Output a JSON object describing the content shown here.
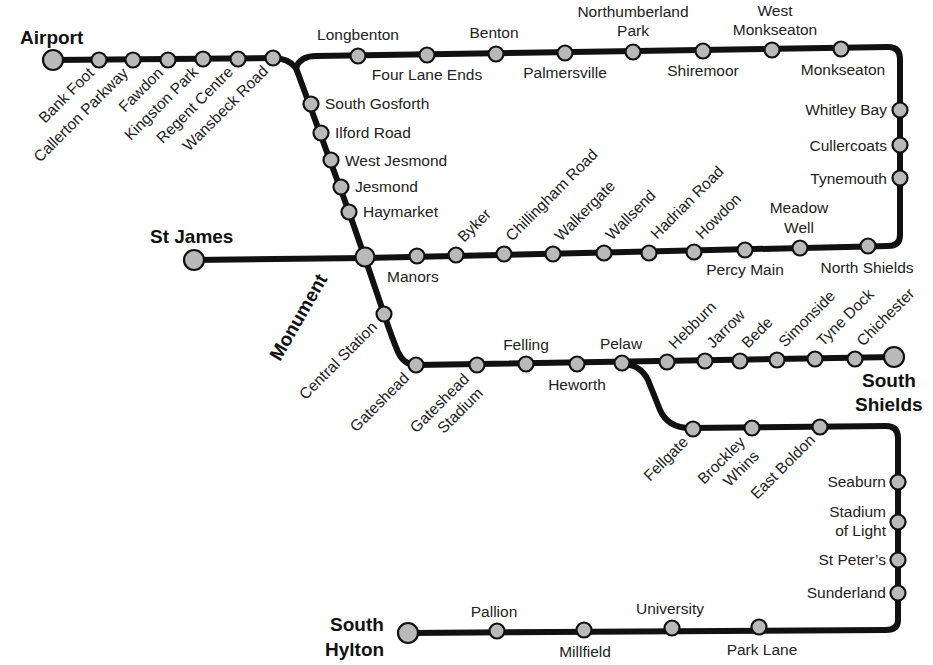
{
  "map": {
    "title": "Tyne and Wear Metro",
    "colors": {
      "track": "#111111",
      "station_fill": "#b9b9b9",
      "station_stroke": "#111111",
      "background": "#ffffff"
    },
    "termini": [
      "Airport",
      "St James",
      "Monument",
      "South Shields",
      "South Hylton"
    ],
    "lines": {
      "airport_branch": [
        "Airport",
        "Bank Foot",
        "Callerton Parkway",
        "Fawdon",
        "Kingston Park",
        "Regent Centre",
        "Wansbeck Road"
      ],
      "coast_north": [
        "Longbenton",
        "Four Lane Ends",
        "Benton",
        "Palmersville",
        "Northumberland Park",
        "Shiremoor",
        "West Monkseaton",
        "Monkseaton"
      ],
      "coast_east": [
        "Whitley Bay",
        "Cullercoats",
        "Tynemouth"
      ],
      "coast_south": [
        "North Shields",
        "Meadow Well",
        "Percy Main",
        "Howdon",
        "Hadrian Road",
        "Wallsend",
        "Walkergate",
        "Chillingham Road",
        "Byker",
        "Manors",
        "Monument",
        "St James"
      ],
      "city_core": [
        "South Gosforth",
        "Ilford Road",
        "West Jesmond",
        "Jesmond",
        "Haymarket",
        "Monument",
        "Central Station",
        "Gateshead"
      ],
      "south_shields_line": [
        "Gateshead",
        "Gateshead Stadium",
        "Felling",
        "Heworth",
        "Pelaw",
        "Hebburn",
        "Jarrow",
        "Bede",
        "Simonside",
        "Tyne Dock",
        "Chichester",
        "South Shields"
      ],
      "sunderland_line": [
        "Pelaw",
        "Fellgate",
        "Brockley Whins",
        "East Boldon",
        "Seaburn",
        "Stadium of Light",
        "St Peter's",
        "Sunderland",
        "Park Lane",
        "University",
        "Millfield",
        "Pallion",
        "South Hylton"
      ]
    },
    "labels": {
      "airport": "Airport",
      "bank_foot": "Bank Foot",
      "callerton_parkway": "Callerton Parkway",
      "fawdon": "Fawdon",
      "kingston_park": "Kingston Park",
      "regent_centre": "Regent Centre",
      "wansbeck_road": "Wansbeck Road",
      "longbenton": "Longbenton",
      "four_lane_ends": "Four Lane Ends",
      "benton": "Benton",
      "palmersville": "Palmersville",
      "northumberland_park_1": "Northumberland",
      "northumberland_park_2": "Park",
      "shiremoor": "Shiremoor",
      "west_monkseaton_1": "West",
      "west_monkseaton_2": "Monkseaton",
      "monkseaton": "Monkseaton",
      "whitley_bay": "Whitley Bay",
      "cullercoats": "Cullercoats",
      "tynemouth": "Tynemouth",
      "north_shields": "North Shields",
      "meadow_well_1": "Meadow",
      "meadow_well_2": "Well",
      "percy_main": "Percy Main",
      "howdon": "Howdon",
      "hadrian_road": "Hadrian Road",
      "wallsend": "Wallsend",
      "walkergate": "Walkergate",
      "chillingham_road": "Chillingham Road",
      "byker": "Byker",
      "manors": "Manors",
      "st_james": "St James",
      "monument": "Monument",
      "south_gosforth": "South Gosforth",
      "ilford_road": "Ilford Road",
      "west_jesmond": "West Jesmond",
      "jesmond": "Jesmond",
      "haymarket": "Haymarket",
      "central_station": "Central Station",
      "gateshead": "Gateshead",
      "gateshead_stadium_1": "Gateshead",
      "gateshead_stadium_2": "Stadium",
      "felling": "Felling",
      "heworth": "Heworth",
      "pelaw": "Pelaw",
      "hebburn": "Hebburn",
      "jarrow": "Jarrow",
      "bede": "Bede",
      "simonside": "Simonside",
      "tyne_dock": "Tyne Dock",
      "chichester": "Chichester",
      "south_shields_1": "South",
      "south_shields_2": "Shields",
      "fellgate": "Fellgate",
      "brockley_whins_1": "Brockley",
      "brockley_whins_2": "Whins",
      "east_boldon": "East Boldon",
      "seaburn": "Seaburn",
      "stadium_of_light_1": "Stadium",
      "stadium_of_light_2": "of Light",
      "st_peters": "St Peter’s",
      "sunderland": "Sunderland",
      "park_lane": "Park Lane",
      "university": "University",
      "millfield": "Millfield",
      "pallion": "Pallion",
      "south_hylton_1": "South",
      "south_hylton_2": "Hylton"
    }
  }
}
